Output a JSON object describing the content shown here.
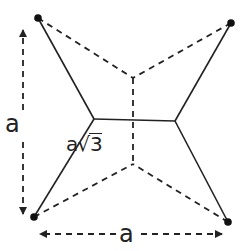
{
  "diagram": {
    "type": "geometry-figure",
    "colors": {
      "line": "#222222",
      "background": "#ffffff"
    },
    "points": {
      "top_left": [
        38,
        18
      ],
      "top_right": [
        231,
        23
      ],
      "bottom_left": [
        34,
        217
      ],
      "bottom_right": [
        228,
        222
      ],
      "solid_junction_left": [
        94,
        119
      ],
      "solid_junction_right": [
        175,
        121
      ],
      "dashed_junction_top": [
        133,
        78
      ],
      "dashed_junction_bottom": [
        133,
        164
      ]
    },
    "labels": {
      "side_vertical": "a",
      "side_horizontal": "a",
      "segment_length_prefix": "a",
      "segment_length_radicand": "3",
      "sqrt_symbol": "√"
    }
  }
}
